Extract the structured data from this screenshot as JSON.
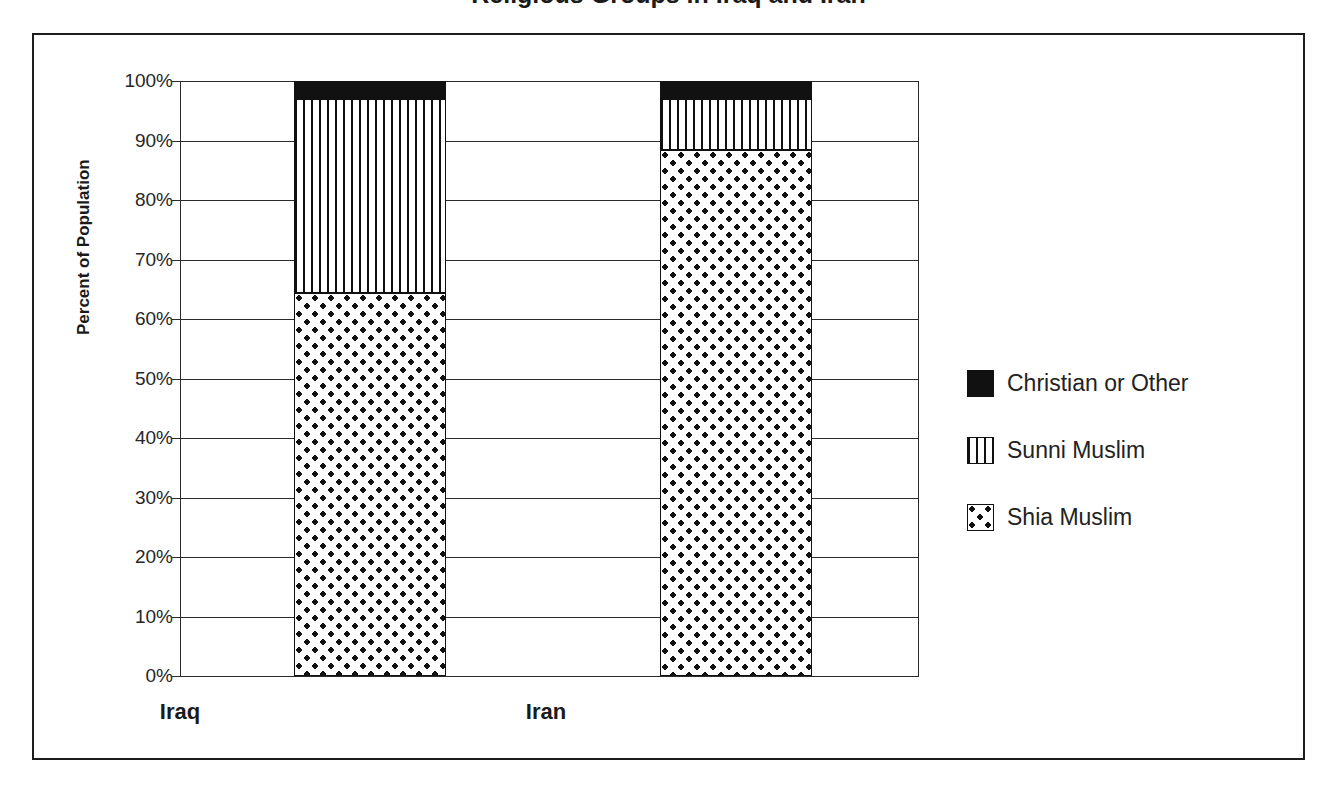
{
  "chart_data": {
    "type": "bar",
    "subtype": "stacked-bar-100",
    "title": "Religious Groups in Iraq and Iran",
    "title_visible_fragment": "g p",
    "xlabel": "",
    "ylabel": "Percent of Population",
    "categories": [
      "Iraq",
      "Iran"
    ],
    "ylim": [
      0,
      100
    ],
    "ytick_labels": [
      "0%",
      "10%",
      "20%",
      "30%",
      "40%",
      "50%",
      "60%",
      "70%",
      "80%",
      "90%",
      "100%"
    ],
    "ytick_values": [
      0,
      10,
      20,
      30,
      40,
      50,
      60,
      70,
      80,
      90,
      100
    ],
    "grid": true,
    "grid_axis": "y",
    "legend_position": "right",
    "series": [
      {
        "name": "Shia Muslim",
        "pattern": "dots",
        "values": [
          64.4,
          88.4
        ]
      },
      {
        "name": "Sunni Muslim",
        "pattern": "stripes",
        "values": [
          32.6,
          8.6
        ]
      },
      {
        "name": "Christian or Other",
        "pattern": "solid",
        "values": [
          3.0,
          3.0
        ]
      }
    ],
    "stack_order_bottom_to_top": [
      "Shia Muslim",
      "Sunni Muslim",
      "Christian or Other"
    ]
  },
  "axis": {
    "y_title": "Percent of Population",
    "ticks": [
      {
        "label": "100%",
        "value": 100
      },
      {
        "label": "90%",
        "value": 90
      },
      {
        "label": "80%",
        "value": 80
      },
      {
        "label": "70%",
        "value": 70
      },
      {
        "label": "60%",
        "value": 60
      },
      {
        "label": "50%",
        "value": 50
      },
      {
        "label": "40%",
        "value": 40
      },
      {
        "label": "30%",
        "value": 30
      },
      {
        "label": "20%",
        "value": 20
      },
      {
        "label": "10%",
        "value": 10
      },
      {
        "label": "0%",
        "value": 0
      }
    ]
  },
  "categories": [
    {
      "label": "Iraq"
    },
    {
      "label": "Iran"
    }
  ],
  "legend": {
    "items": [
      {
        "label": "Christian or Other",
        "pattern": "solid"
      },
      {
        "label": "Sunni Muslim",
        "pattern": "stripes"
      },
      {
        "label": "Shia Muslim",
        "pattern": "dots"
      }
    ]
  },
  "colors": {
    "ink": "#111111",
    "frame": "#1d1d1d",
    "background": "#ffffff",
    "grid": "#2b2b2b"
  }
}
